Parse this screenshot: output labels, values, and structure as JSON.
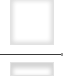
{
  "panel": {
    "items": [
      {
        "kind": "thumbnail",
        "state": "empty"
      },
      {
        "kind": "thumbnail",
        "state": "empty"
      }
    ],
    "divider": {
      "color": "#3a3a3a"
    },
    "colors": {
      "background": "#ffffff",
      "thumbnail_border": "#e2e2e2",
      "thumbnail_shadow": "#dcdcdc"
    }
  }
}
